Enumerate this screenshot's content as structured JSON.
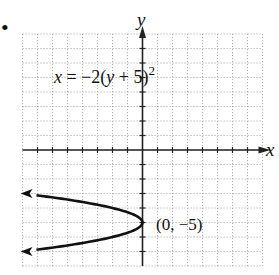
{
  "chart_data": {
    "type": "line",
    "title": "",
    "equation": "x = −2(y + 5)²",
    "equation_parts": {
      "lhs": "x",
      "eq": " = −2(",
      "var": "y",
      "rest": " + 5)",
      "exp": "2"
    },
    "xlabel": "x",
    "ylabel": "y",
    "xlim": [
      -8,
      8
    ],
    "ylim": [
      -8,
      8
    ],
    "grid": true,
    "grid_step": 1,
    "series": [
      {
        "name": "x = -2(y + 5)^2",
        "x": [
          -8,
          -4.5,
          -2,
          -0.5,
          0,
          -0.5,
          -2,
          -4.5,
          -8
        ],
        "y": [
          -3,
          -3.5,
          -4,
          -4.5,
          -5,
          -5.5,
          -6,
          -6.5,
          -7
        ],
        "arrows_at_ends": true
      }
    ],
    "annotations": [
      {
        "text": "(0, −5)",
        "x": 0,
        "y": -5
      }
    ]
  },
  "labels": {
    "bullet": "•",
    "x_axis": "x",
    "y_axis": "y",
    "vertex": "(0, −5)"
  }
}
